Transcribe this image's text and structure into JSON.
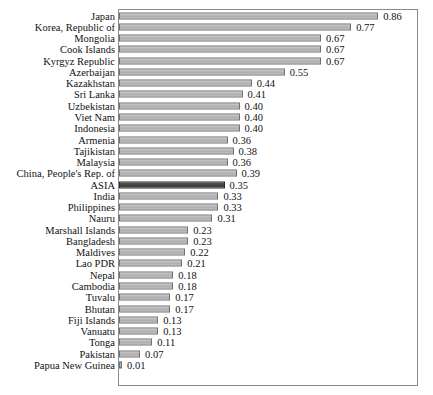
{
  "chart_data": {
    "type": "bar",
    "orientation": "horizontal",
    "title": "",
    "xlabel": "",
    "ylabel": "",
    "xlim": [
      0,
      0.9
    ],
    "grid": false,
    "legend": null,
    "value_labels": true,
    "highlight_category": "ASIA",
    "categories": [
      "Japan",
      "Korea, Republic of",
      "Mongolia",
      "Cook Islands",
      "Kyrgyz Republic",
      "Azerbaijan",
      "Kazakhstan",
      "Sri Lanka",
      "Uzbekistan",
      "Viet Nam",
      "Indonesia",
      "Armenia",
      "Tajikistan",
      "Malaysia",
      "China, People's Rep. of",
      "ASIA",
      "India",
      "Philippines",
      "Nauru",
      "Marshall Islands",
      "Bangladesh",
      "Maldives",
      "Lao PDR",
      "Nepal",
      "Cambodia",
      "Tuvalu",
      "Bhutan",
      "Fiji Islands",
      "Vanuatu",
      "Tonga",
      "Pakistan",
      "Papua New Guinea"
    ],
    "values": [
      0.86,
      0.77,
      0.67,
      0.67,
      0.67,
      0.55,
      0.44,
      0.41,
      0.4,
      0.4,
      0.4,
      0.36,
      0.38,
      0.36,
      0.39,
      0.35,
      0.33,
      0.33,
      0.31,
      0.23,
      0.23,
      0.22,
      0.21,
      0.18,
      0.18,
      0.17,
      0.17,
      0.13,
      0.13,
      0.11,
      0.07,
      0.01
    ],
    "value_text": [
      "0.86",
      "0.77",
      "0.67",
      "0.67",
      "0.67",
      "0.55",
      "0.44",
      "0.41",
      "0.40",
      "0.40",
      "0.40",
      "0.36",
      "0.38",
      "0.36",
      "0.39",
      "0.35",
      "0.33",
      "0.33",
      "0.31",
      "0.23",
      "0.23",
      "0.22",
      "0.21",
      "0.18",
      "0.18",
      "0.17",
      "0.17",
      "0.13",
      "0.13",
      "0.11",
      "0.07",
      "0.01"
    ]
  },
  "style": {
    "bar_fill": "#b5b5b5",
    "bar_stroke": "#6f6f6f",
    "highlight_fill": "#444444",
    "highlight_stroke": "#2a2a2a",
    "frame_stroke": "#8a8a8a",
    "text_color": "#111111",
    "background": "#ffffff"
  }
}
